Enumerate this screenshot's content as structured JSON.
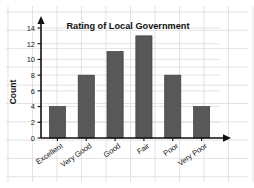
{
  "chart_data": {
    "type": "bar",
    "title": "Rating of Local Government",
    "xlabel": "",
    "ylabel": "Count",
    "categories": [
      "Excellent",
      "Very Good",
      "Good",
      "Fair",
      "Poor",
      "Very Poor"
    ],
    "values": [
      4,
      8,
      11,
      13,
      8,
      4
    ],
    "ylim": [
      0,
      14
    ],
    "ytick_labels": [
      "0",
      "2",
      "4",
      "6",
      "8",
      "10",
      "12",
      "14"
    ],
    "ytick_values": [
      0,
      2,
      4,
      6,
      8,
      10,
      12,
      14
    ],
    "grid": true,
    "legend": false,
    "legend_position": "none",
    "bar_color": "#585858",
    "bar_edge_color": "#3d3d3d",
    "grid_color": "#dcdcdc",
    "axis_color": "#111111",
    "background_color": "#ffffff",
    "x_axis_has_arrow": true,
    "y_axis_has_arrow": true,
    "category_label_rotation": -35
  }
}
